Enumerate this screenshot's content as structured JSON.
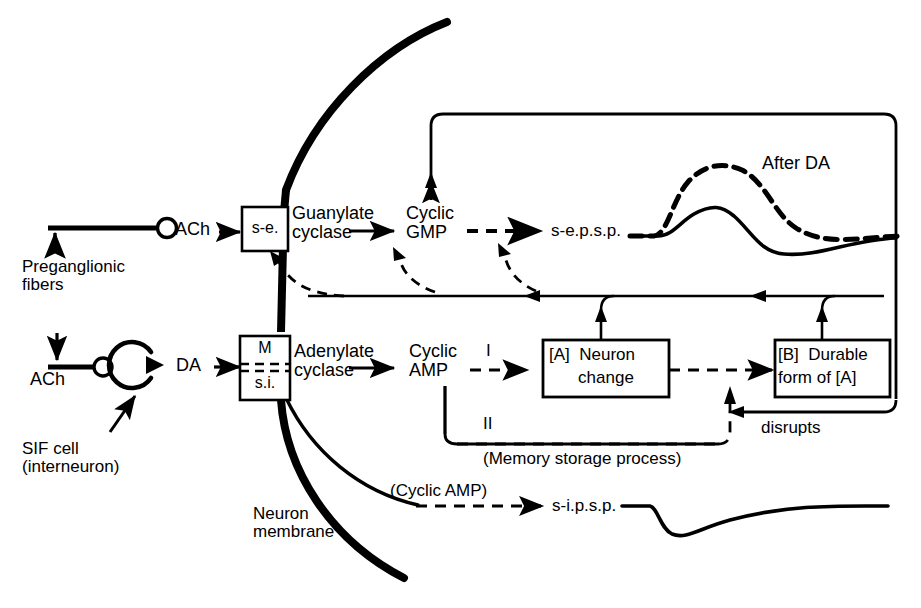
{
  "figure": {
    "type": "neuroscience-signaling-diagram",
    "title_visible": false
  },
  "left_inputs": {
    "preganglionic": {
      "label": "Preganglionic\nfibers",
      "transmitter": "ACh",
      "terminal_icon": "bouton-circle-icon"
    },
    "sif": {
      "transmitter_in": "ACh",
      "cell_label": "SIF cell\n(interneuron)",
      "cell_icon": "circular-interneuron-icon",
      "transmitter_out": "DA"
    }
  },
  "membrane": {
    "label": "Neuron\nmembrane",
    "icon": "membrane-arc-icon"
  },
  "receptors": {
    "upper": {
      "box_label": "s-e.",
      "enzyme": "Guanylate\ncyclase",
      "second_messenger": "Cyclic\nGMP"
    },
    "lower": {
      "box_label_top": "M",
      "box_label_bottom": "s.i.",
      "enzyme": "Adenylate\ncyclase",
      "second_messenger": "Cyclic\nAMP"
    }
  },
  "pathways": {
    "branch_I": "I",
    "branch_II": "II",
    "memory_caption": "(Memory storage process)",
    "cyclic_amp_to_sipsp": "(Cyclic AMP)",
    "disrupts": "disrupts"
  },
  "boxes": {
    "a": "[A]  Neuron\nchange",
    "a_line1": "[A]  Neuron",
    "a_line2": "change",
    "b": "[B]  Durable\nform of [A]",
    "b_line1": "[B]  Durable",
    "b_line2": "form of [A]"
  },
  "potentials": {
    "sepsp_label": "s-e.p.s.p.",
    "sepsp_after": "After DA",
    "sipsp_label": "s-i.p.s.p."
  },
  "colors": {
    "ink": "#000000",
    "background": "#ffffff"
  }
}
